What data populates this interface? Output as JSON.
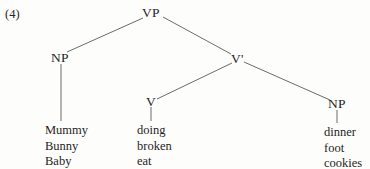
{
  "example": {
    "number": "(4)"
  },
  "tree": {
    "nodes": {
      "vp": "VP",
      "np_subject": "NP",
      "vbar": "V'",
      "v": "V",
      "np_object": "NP"
    }
  },
  "terminals": {
    "subject": {
      "words": [
        "Mummy",
        "Bunny",
        "Baby"
      ]
    },
    "verb": {
      "words": [
        "doing",
        "broken",
        "eat"
      ]
    },
    "object": {
      "words": [
        "dinner",
        "foot",
        "cookies"
      ]
    }
  },
  "style": {
    "line_color": "#5a5a5a",
    "text_color": "#1f1f1f",
    "background": "#fdfdfb"
  }
}
